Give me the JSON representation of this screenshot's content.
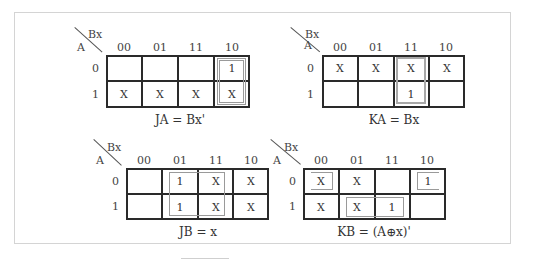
{
  "diagram": {
    "row_variable": "A",
    "col_variable": "Bx",
    "col_labels": [
      "00",
      "01",
      "11",
      "10"
    ],
    "row_labels": [
      "0",
      "1"
    ],
    "maps": [
      {
        "name": "JA",
        "equation": "JA = Bx'",
        "cells": [
          [
            "",
            "",
            "",
            "1"
          ],
          [
            "X",
            "X",
            "X",
            "X"
          ]
        ],
        "groups": [
          {
            "rows": [
              0,
              1
            ],
            "cols": [
              3
            ],
            "style": "double"
          }
        ]
      },
      {
        "name": "KA",
        "equation": "KA = Bx",
        "cells": [
          [
            "X",
            "X",
            "X",
            "X"
          ],
          [
            "",
            "",
            "1",
            ""
          ]
        ],
        "groups": [
          {
            "rows": [
              0,
              1
            ],
            "cols": [
              2
            ],
            "style": "single"
          }
        ]
      },
      {
        "name": "JB",
        "equation": "JB = x",
        "cells": [
          [
            "",
            "1",
            "X",
            "X"
          ],
          [
            "",
            "1",
            "X",
            "X"
          ]
        ],
        "groups": [
          {
            "rows": [
              0,
              1
            ],
            "cols": [
              1,
              2
            ],
            "style": "single"
          }
        ]
      },
      {
        "name": "KB",
        "equation": "KB = (A⊕x)'",
        "cells": [
          [
            "X",
            "X",
            "",
            "1"
          ],
          [
            "X",
            "X",
            "1",
            ""
          ]
        ],
        "groups": [
          {
            "rows": [
              0
            ],
            "cols": [
              0
            ],
            "style": "open-wrap-left"
          },
          {
            "rows": [
              0
            ],
            "cols": [
              3
            ],
            "style": "open-wrap-right"
          },
          {
            "rows": [
              1
            ],
            "cols": [
              1,
              2
            ],
            "style": "single"
          }
        ]
      }
    ]
  }
}
